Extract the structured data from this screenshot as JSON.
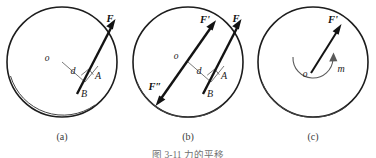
{
  "figure": {
    "caption": "图 3-11  力的平移",
    "caption_visible_partial": true,
    "background_color": "#ffffff",
    "line_color": "#131313",
    "thin_line_color": "#6a6a6a"
  },
  "panels": [
    {
      "id": "a",
      "caption": "(a)",
      "center": {
        "cx": 62,
        "cy": 62,
        "r": 55
      },
      "labels": {
        "center_point": "o",
        "distance": "d",
        "point_a": "A",
        "point_b": "B",
        "force": "F"
      },
      "description": "Disk with force F applied at point A on the rim; perpendicular distance d from center o to line of action, foot at B."
    },
    {
      "id": "b",
      "caption": "(b)",
      "center": {
        "cx": 188,
        "cy": 62,
        "r": 55
      },
      "labels": {
        "center_point": "o",
        "distance": "d",
        "point_a": "A",
        "point_b": "B",
        "force": "F",
        "force_prime": "F'",
        "force_double_prime": "F″"
      },
      "description": "Same disk with an equal and opposite pair F' and F″ added at center o, parallel to F."
    },
    {
      "id": "c",
      "caption": "(c)",
      "center": {
        "cx": 313,
        "cy": 62,
        "r": 55
      },
      "labels": {
        "center_point": "o",
        "force_prime": "F'",
        "moment": "m"
      },
      "description": "Resulting equivalent system: force F' acting at center o plus a couple moment m shown as a curved arrow."
    }
  ]
}
